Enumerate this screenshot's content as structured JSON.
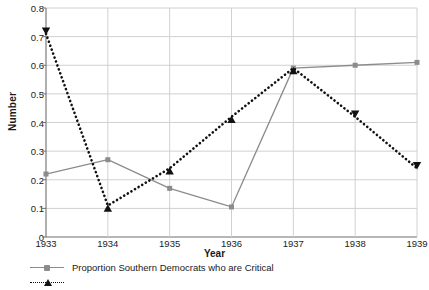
{
  "chart_data": {
    "type": "line",
    "title": "",
    "xlabel": "Year",
    "ylabel": "Number",
    "categories": [
      "1933",
      "1934",
      "1935",
      "1936",
      "1937",
      "1938",
      "1939"
    ],
    "xlim": [
      "1933",
      "1939"
    ],
    "ylim": [
      0,
      0.8
    ],
    "yticks": [
      "0",
      "0.1",
      "0.2",
      "0.3",
      "0.4",
      "0.5",
      "0.6",
      "0.7",
      "0.8"
    ],
    "ytick_values": [
      0,
      0.1,
      0.2,
      0.3,
      0.4,
      0.5,
      0.6,
      0.7,
      0.8
    ],
    "grid": "horizontal-and-vertical",
    "legend_position": "bottom-left",
    "series": [
      {
        "name": "Proportion Southern Democrats who are Critical",
        "values": [
          0.22,
          0.27,
          0.17,
          0.105,
          0.59,
          0.6,
          0.61
        ],
        "color": "#8c8c8c",
        "line_style": "solid",
        "marker": "square"
      },
      {
        "name": "",
        "values": [
          0.71,
          0.11,
          0.24,
          0.42,
          0.59,
          0.42,
          0.24
        ],
        "color": "#111111",
        "line_style": "dotted",
        "marker": "triangle"
      }
    ]
  },
  "legend": {
    "entries": [
      {
        "label": "Proportion Southern Democrats who are Critical"
      },
      {
        "label": ""
      }
    ]
  }
}
